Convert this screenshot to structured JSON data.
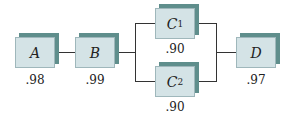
{
  "diagram": {
    "type": "reliability-block-diagram",
    "components": [
      {
        "id": "A",
        "label": "A",
        "subscript": "",
        "reliability": ".98"
      },
      {
        "id": "B",
        "label": "B",
        "subscript": "",
        "reliability": ".99"
      },
      {
        "id": "C1",
        "label": "C",
        "subscript": "1",
        "reliability": ".90"
      },
      {
        "id": "C2",
        "label": "C",
        "subscript": "2",
        "reliability": ".90"
      },
      {
        "id": "D",
        "label": "D",
        "subscript": "",
        "reliability": ".97"
      }
    ],
    "connections": [
      {
        "from": "A",
        "to": "B",
        "type": "series"
      },
      {
        "from": "B",
        "to": [
          "C1",
          "C2"
        ],
        "type": "parallel-split"
      },
      {
        "from": [
          "C1",
          "C2"
        ],
        "to": "D",
        "type": "parallel-join"
      }
    ],
    "colors": {
      "face": "#d4e3e6",
      "shadow": "#5f8e8c",
      "line": "#333333"
    }
  }
}
